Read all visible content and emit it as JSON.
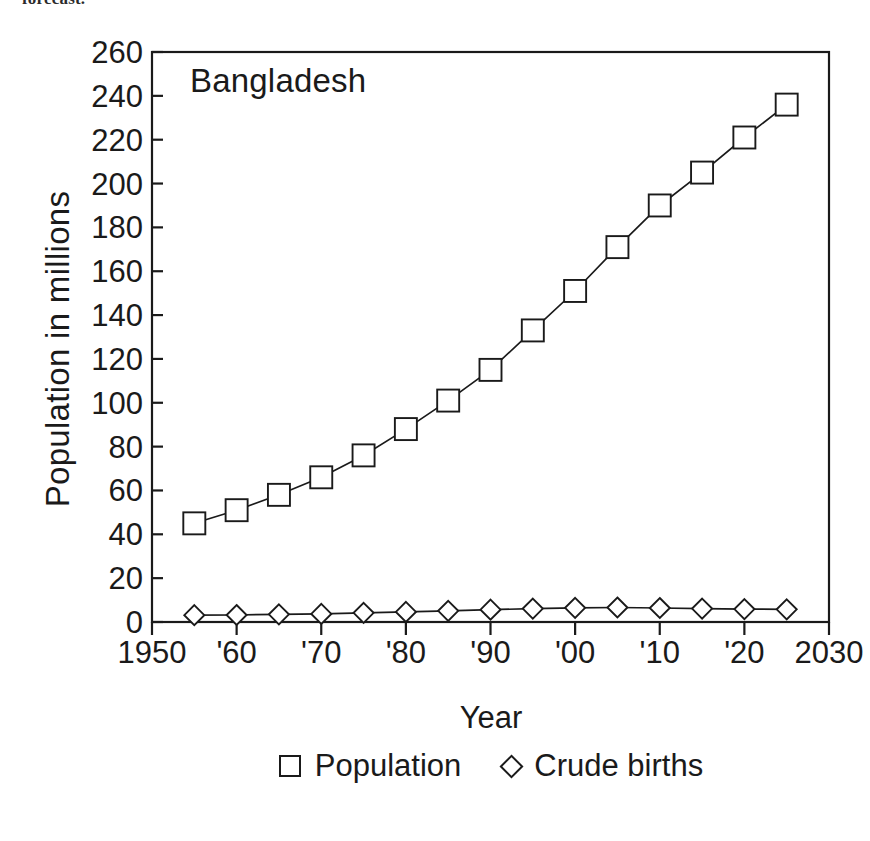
{
  "caption_fragment": "forecast.",
  "chart_data": {
    "type": "line",
    "title": "Bangladesh",
    "xlabel": "Year",
    "ylabel": "Population in millions",
    "xlim": [
      1950,
      2030
    ],
    "ylim": [
      0,
      260
    ],
    "grid": false,
    "legend_position": "below",
    "xticks": [
      1950,
      1960,
      1970,
      1980,
      1990,
      2000,
      2010,
      2020,
      2030
    ],
    "xticklabels": [
      "1950",
      "'60",
      "'70",
      "'80",
      "'90",
      "'00",
      "'10",
      "'20",
      "2030"
    ],
    "yticks": [
      0,
      20,
      40,
      60,
      80,
      100,
      120,
      140,
      160,
      180,
      200,
      220,
      240,
      260
    ],
    "yticklabels": [
      "0",
      "20",
      "40",
      "60",
      "80",
      "100",
      "120",
      "140",
      "160",
      "180",
      "200",
      "220",
      "240",
      "260"
    ],
    "x": [
      1955,
      1960,
      1965,
      1970,
      1975,
      1980,
      1985,
      1990,
      1995,
      2000,
      2005,
      2010,
      2015,
      2020,
      2025
    ],
    "series": [
      {
        "name": "Population",
        "marker": "square",
        "values": [
          45,
          51,
          58,
          66,
          76,
          88,
          101,
          115,
          133,
          151,
          171,
          190,
          205,
          221,
          236
        ]
      },
      {
        "name": "Crude births",
        "marker": "diamond",
        "values": [
          3.1,
          3.2,
          3.5,
          3.7,
          4.2,
          4.6,
          5.1,
          5.6,
          6.1,
          6.5,
          6.6,
          6.4,
          6.1,
          5.9,
          5.8
        ]
      }
    ]
  },
  "legend": [
    {
      "label": "Population",
      "marker": "square"
    },
    {
      "label": "Crude births",
      "marker": "diamond"
    }
  ],
  "colors": {
    "ink": "#1a1a1a",
    "background": "#ffffff"
  }
}
